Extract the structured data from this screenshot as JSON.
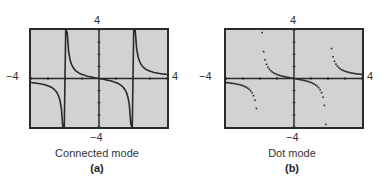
{
  "chart_data": [
    {
      "type": "line",
      "title": "",
      "caption": "Connected mode",
      "sublabel": "(a)",
      "function": "y = x/(x^2 - 4)",
      "mode": "connected",
      "xlim": [
        -4,
        4
      ],
      "ylim": [
        -4,
        4
      ],
      "tick_labels": {
        "top": "4",
        "bottom": "−4",
        "left": "−4",
        "right": "4"
      },
      "grid": false,
      "asymptotes_drawn": [
        -2,
        2
      ]
    },
    {
      "type": "scatter",
      "title": "",
      "caption": "Dot mode",
      "sublabel": "(b)",
      "function": "y = x/(x^2 - 4)",
      "mode": "dot",
      "xlim": [
        -4,
        4
      ],
      "ylim": [
        -4,
        4
      ],
      "tick_labels": {
        "top": "4",
        "bottom": "−4",
        "left": "−4",
        "right": "4"
      },
      "grid": false
    }
  ],
  "panels": [
    {
      "top": "4",
      "bottom": "−4",
      "left": "−4",
      "right": "4",
      "caption": "Connected mode",
      "sub": "(a)"
    },
    {
      "top": "4",
      "bottom": "−4",
      "left": "−4",
      "right": "4",
      "caption": "Dot mode",
      "sub": "(b)"
    }
  ]
}
